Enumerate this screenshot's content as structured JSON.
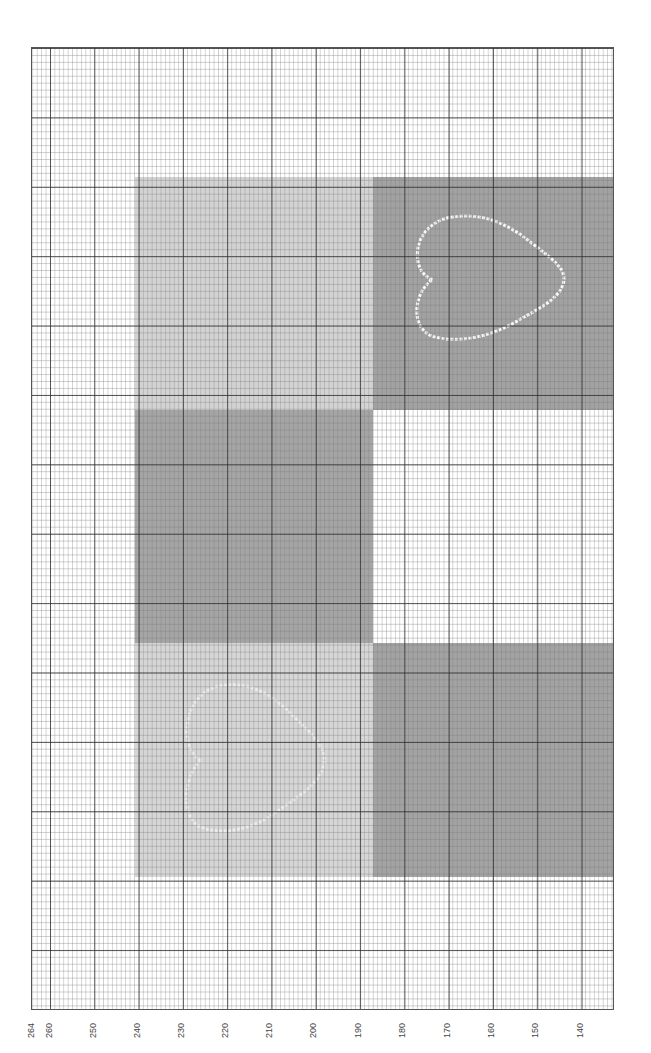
{
  "axis": {
    "orientation": "rotated-bottom",
    "ticks": [
      {
        "label": "264",
        "x": 31
      },
      {
        "label": "260",
        "x": 49
      },
      {
        "label": "250",
        "x": 93
      },
      {
        "label": "240",
        "x": 137
      },
      {
        "label": "230",
        "x": 181
      },
      {
        "label": "220",
        "x": 225
      },
      {
        "label": "210",
        "x": 269
      },
      {
        "label": "200",
        "x": 313
      },
      {
        "label": "190",
        "x": 358
      },
      {
        "label": "180",
        "x": 402
      },
      {
        "label": "170",
        "x": 447
      },
      {
        "label": "160",
        "x": 491
      },
      {
        "label": "150",
        "x": 535
      },
      {
        "label": "140",
        "x": 580
      }
    ]
  },
  "blocks": [
    {
      "name": "block-left-top",
      "color": "#d3d3d3",
      "x": 135,
      "y": 177,
      "w": 238,
      "h": 233
    },
    {
      "name": "block-right-top",
      "color": "#a2a2a2",
      "x": 373,
      "y": 177,
      "w": 241,
      "h": 233
    },
    {
      "name": "block-left-middle",
      "color": "#a5a5a5",
      "x": 135,
      "y": 410,
      "w": 238,
      "h": 233
    },
    {
      "name": "block-right-middle",
      "color": "#ffffff",
      "x": 373,
      "y": 410,
      "w": 241,
      "h": 233
    },
    {
      "name": "block-left-bottom",
      "color": "#d6d6d6",
      "x": 135,
      "y": 643,
      "w": 238,
      "h": 234
    },
    {
      "name": "block-right-bottom",
      "color": "#a3a3a3",
      "x": 373,
      "y": 643,
      "w": 241,
      "h": 234
    }
  ],
  "hearts": [
    {
      "name": "heart-outline-dark-block",
      "x": 410,
      "y": 212,
      "w": 160,
      "h": 135,
      "color": "#ffffff",
      "opacity": 0.95
    },
    {
      "name": "heart-outline-light-block",
      "x": 180,
      "y": 680,
      "w": 150,
      "h": 160,
      "color": "#f2f2f2",
      "opacity": 0.8
    }
  ]
}
